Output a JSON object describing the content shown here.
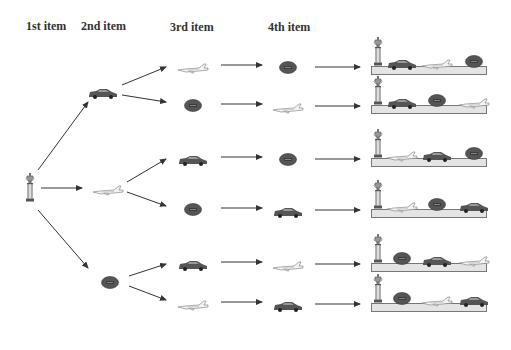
{
  "headers": [
    {
      "label": "1st item",
      "x": 26,
      "y": 19
    },
    {
      "label": "2nd item",
      "x": 81,
      "y": 19
    },
    {
      "label": "3rd item",
      "x": 170,
      "y": 20
    },
    {
      "label": "4th item",
      "x": 268,
      "y": 20
    }
  ],
  "root": {
    "item": "trophy",
    "x": 30,
    "y": 187
  },
  "level2": [
    {
      "item": "car",
      "x": 103,
      "y": 90
    },
    {
      "item": "plane",
      "x": 108,
      "y": 187
    },
    {
      "item": "football",
      "x": 110,
      "y": 281
    }
  ],
  "branches": [
    {
      "third": "plane",
      "fourth": "football",
      "y": 65,
      "shelf": [
        "car",
        "plane",
        "football"
      ]
    },
    {
      "third": "football",
      "fourth": "plane",
      "y": 104,
      "shelf": [
        "car",
        "football",
        "plane"
      ]
    },
    {
      "third": "car",
      "fourth": "football",
      "y": 157,
      "shelf": [
        "plane",
        "car",
        "football"
      ]
    },
    {
      "third": "football",
      "fourth": "car",
      "y": 208,
      "shelf": [
        "plane",
        "football",
        "car"
      ]
    },
    {
      "third": "car",
      "fourth": "plane",
      "y": 262,
      "shelf": [
        "football",
        "car",
        "plane"
      ]
    },
    {
      "third": "plane",
      "fourth": "car",
      "y": 302,
      "shelf": [
        "football",
        "plane",
        "car"
      ]
    }
  ],
  "colors": {
    "arrow": "#333333",
    "shelf_fill": "#e4e4e4",
    "shelf_border": "#777777",
    "icon_dark": "#555555",
    "header_text": "#333333"
  }
}
